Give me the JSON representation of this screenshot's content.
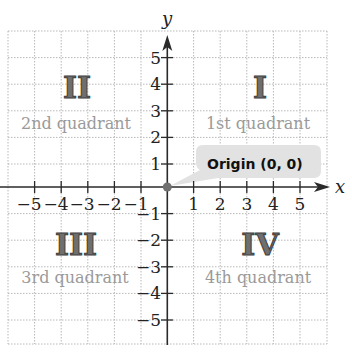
{
  "diagram": {
    "type": "coordinate-plane",
    "axes": {
      "x_label": "x",
      "y_label": "y",
      "x_ticks": [
        "−5",
        "−4",
        "−3",
        "−2",
        "−1",
        "1",
        "2",
        "3",
        "4",
        "5"
      ],
      "y_ticks": [
        "5",
        "4",
        "3",
        "2",
        "1",
        "−1",
        "−2",
        "−3",
        "−4",
        "−5"
      ],
      "range": [
        -6,
        6
      ]
    },
    "quadrants": [
      {
        "numeral": "I",
        "label": "1st quadrant"
      },
      {
        "numeral": "II",
        "label": "2nd quadrant"
      },
      {
        "numeral": "III",
        "label": "3rd quadrant"
      },
      {
        "numeral": "IV",
        "label": "4th quadrant"
      }
    ],
    "origin_callout": "Origin (0, 0)",
    "colors": {
      "axis": "#2a2a2a",
      "grid": "#b8b8b8",
      "numeral_fill": "#6f6f6f",
      "quadrant_label": "#9a9a9a",
      "callout_bg": "#e2e2e2",
      "origin_dot": "#707070"
    }
  }
}
